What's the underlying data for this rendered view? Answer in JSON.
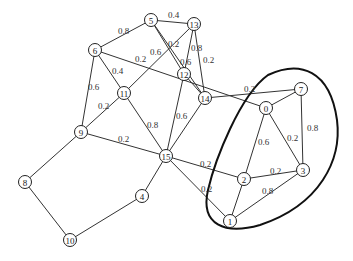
{
  "nodes": [
    {
      "id": "0",
      "x": 266,
      "y": 108
    },
    {
      "id": "1",
      "x": 230,
      "y": 221
    },
    {
      "id": "2",
      "x": 244,
      "y": 179
    },
    {
      "id": "3",
      "x": 303,
      "y": 170
    },
    {
      "id": "4",
      "x": 142,
      "y": 196
    },
    {
      "id": "5",
      "x": 151,
      "y": 20
    },
    {
      "id": "6",
      "x": 95,
      "y": 50
    },
    {
      "id": "7",
      "x": 301,
      "y": 89
    },
    {
      "id": "8",
      "x": 25,
      "y": 182
    },
    {
      "id": "9",
      "x": 81,
      "y": 132
    },
    {
      "id": "10",
      "x": 70,
      "y": 240
    },
    {
      "id": "11",
      "x": 124,
      "y": 93
    },
    {
      "id": "12",
      "x": 184,
      "y": 74
    },
    {
      "id": "13",
      "x": 194,
      "y": 24
    },
    {
      "id": "14",
      "x": 205,
      "y": 98
    },
    {
      "id": "15",
      "x": 166,
      "y": 156
    }
  ],
  "edges": [
    {
      "from": "5",
      "to": "13",
      "w": "0.4",
      "lx": 168,
      "ly": 18
    },
    {
      "from": "5",
      "to": "6",
      "w": "0.8",
      "lx": 118,
      "ly": 34
    },
    {
      "from": "5",
      "to": "12",
      "w": "0.2",
      "lx": 168,
      "ly": 47
    },
    {
      "from": "5",
      "to": "14",
      "w": "",
      "lx": 0,
      "ly": 0
    },
    {
      "from": "13",
      "to": "11",
      "w": "0.6",
      "lx": 150,
      "ly": 55
    },
    {
      "from": "13",
      "to": "12",
      "w": "0.8",
      "lx": 191,
      "ly": 51
    },
    {
      "from": "13",
      "to": "14",
      "w": "0.2",
      "lx": 203,
      "ly": 63
    },
    {
      "from": "6",
      "to": "0",
      "w": "0.2",
      "lx": 135,
      "ly": 62
    },
    {
      "from": "6",
      "to": "11",
      "w": "0.4",
      "lx": 112,
      "ly": 74
    },
    {
      "from": "6",
      "to": "9",
      "w": "0.6",
      "lx": 88,
      "ly": 90
    },
    {
      "from": "12",
      "to": "15",
      "w": "0.6",
      "lx": 176,
      "ly": 119
    },
    {
      "from": "12",
      "to": "14",
      "w": "0.6",
      "lx": 180,
      "ly": 65
    },
    {
      "from": "14",
      "to": "7",
      "w": "0.2",
      "lx": 244,
      "ly": 92
    },
    {
      "from": "14",
      "to": "15",
      "w": "",
      "lx": 0,
      "ly": 0
    },
    {
      "from": "11",
      "to": "9",
      "w": "0.2",
      "lx": 98,
      "ly": 109
    },
    {
      "from": "11",
      "to": "15",
      "w": "0.8",
      "lx": 147,
      "ly": 128
    },
    {
      "from": "9",
      "to": "15",
      "w": "0.2",
      "lx": 118,
      "ly": 142
    },
    {
      "from": "9",
      "to": "8",
      "w": "",
      "lx": 0,
      "ly": 0
    },
    {
      "from": "8",
      "to": "10",
      "w": "",
      "lx": 0,
      "ly": 0
    },
    {
      "from": "10",
      "to": "4",
      "w": "",
      "lx": 0,
      "ly": 0
    },
    {
      "from": "4",
      "to": "15",
      "w": "",
      "lx": 0,
      "ly": 0
    },
    {
      "from": "15",
      "to": "2",
      "w": "0.2",
      "lx": 200,
      "ly": 167
    },
    {
      "from": "15",
      "to": "1",
      "w": "0.2",
      "lx": 201,
      "ly": 192
    },
    {
      "from": "0",
      "to": "7",
      "w": "",
      "lx": 0,
      "ly": 0
    },
    {
      "from": "0",
      "to": "2",
      "w": "0.6",
      "lx": 258,
      "ly": 145
    },
    {
      "from": "0",
      "to": "3",
      "w": "0.2",
      "lx": 287,
      "ly": 141
    },
    {
      "from": "7",
      "to": "3",
      "w": "0.8",
      "lx": 307,
      "ly": 131
    },
    {
      "from": "2",
      "to": "3",
      "w": "0.2",
      "lx": 270,
      "ly": 174
    },
    {
      "from": "1",
      "to": "3",
      "w": "0.8",
      "lx": 262,
      "ly": 194
    },
    {
      "from": "1",
      "to": "2",
      "w": "",
      "lx": 0,
      "ly": 0
    }
  ],
  "cluster_path": "M268 75 C300 60 330 70 337 120 C342 160 320 205 260 225 C225 235 200 225 208 190 C215 160 240 95 268 75 Z"
}
